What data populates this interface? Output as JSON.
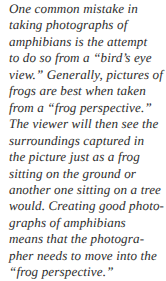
{
  "document": {
    "type": "book-caption",
    "background_color": "#ffffff",
    "text_color": "#2b2b2b",
    "style": "italic-serif",
    "full_text": "One common mistake in taking photographs of amphibians is the attempt to do so from a “bird’s eye view.” Generally, pictures of frogs are best when taken from a “frog perspective.” The viewer will then see the surroundings captured in the picture just as a frog sitting on the ground or another one sitting on a tree would. Creating good photographs of amphibians means that the photographer needs to move into the “frog perspective.”",
    "lines": [
      "One common mistake in",
      "taking photographs of",
      "amphibians is the attempt",
      "to do so from a “bird’s eye",
      "view.” Generally, pictures of",
      "frogs are best when taken",
      "from a “frog perspective.”",
      "The viewer will then see the",
      "surroundings captured in",
      "the picture just as a frog",
      "sitting on the ground or",
      "another one sitting on a tree",
      "would. Creating good photo-",
      "graphs of amphibians",
      "means that the photogra-",
      "pher needs to move into the",
      "“frog perspective.”"
    ]
  }
}
